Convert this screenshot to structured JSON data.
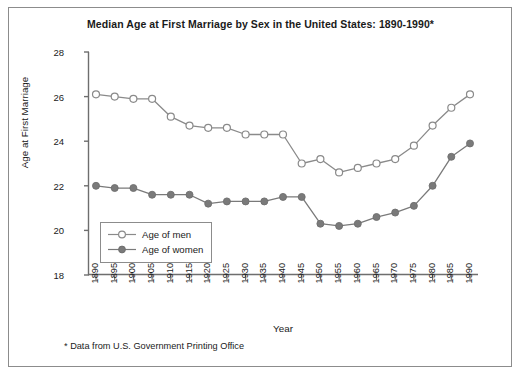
{
  "chart_data": {
    "type": "line",
    "title": "Median Age at First Marriage by Sex in the United States: 1890-1990*",
    "xlabel": "Year",
    "ylabel": "Age at First Marriage",
    "categories": [
      1890,
      1895,
      1900,
      1905,
      1910,
      1915,
      1920,
      1925,
      1930,
      1935,
      1940,
      1945,
      1950,
      1955,
      1960,
      1965,
      1970,
      1975,
      1980,
      1985,
      1990
    ],
    "xtick_labels": [
      "1890",
      "1895",
      "1900",
      "1905",
      "1910",
      "1915",
      "1920",
      "1925",
      "1930",
      "1935",
      "1940",
      "1945",
      "1950",
      "1955",
      "1960",
      "1965",
      "1970",
      "1975",
      "1980",
      "1985",
      "1990"
    ],
    "ytick_labels": [
      "28",
      "26",
      "24",
      "22",
      "20",
      "18"
    ],
    "ytick_values": [
      28,
      26,
      24,
      22,
      20,
      18
    ],
    "ylim": [
      18,
      28
    ],
    "xlim": [
      1890,
      1990
    ],
    "grid": false,
    "legend_position": "inside-lower-left",
    "series": [
      {
        "name": "Age of men",
        "marker": "open-circle",
        "color": "#8a8a8a",
        "values": [
          26.1,
          26.0,
          25.9,
          25.9,
          25.1,
          24.7,
          24.6,
          24.6,
          24.3,
          24.3,
          24.3,
          23.0,
          23.2,
          22.6,
          22.8,
          23.0,
          23.2,
          23.8,
          24.7,
          25.5,
          26.1
        ]
      },
      {
        "name": "Age of women",
        "marker": "filled-circle",
        "color": "#7a7a7a",
        "values": [
          22.0,
          21.9,
          21.9,
          21.6,
          21.6,
          21.6,
          21.2,
          21.3,
          21.3,
          21.3,
          21.5,
          21.5,
          20.3,
          20.2,
          20.3,
          20.6,
          20.8,
          21.1,
          22.0,
          23.3,
          23.9
        ]
      }
    ],
    "footnote": "* Data from U.S. Government Printing Office"
  },
  "legend": {
    "items": [
      {
        "label": "Age of men"
      },
      {
        "label": "Age of women"
      }
    ]
  },
  "colors": {
    "men_line": "#8a8a8a",
    "women_line": "#7a7a7a",
    "axis": "#6e6e6e",
    "frame": "#8c8c8c",
    "text": "#1a1a1a"
  }
}
